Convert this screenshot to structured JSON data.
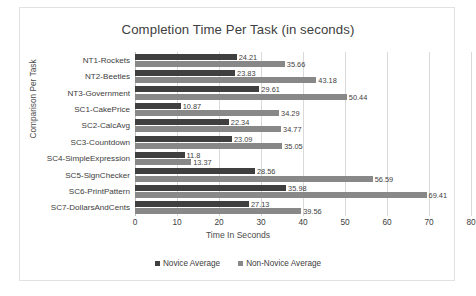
{
  "chart_data": {
    "type": "bar",
    "orientation": "horizontal",
    "title": "Completion Time Per Task (in seconds)",
    "xlabel": "Time In Seconds",
    "ylabel": "Comparison Per Task",
    "xlim": [
      0,
      80
    ],
    "xticks": [
      0,
      10,
      20,
      30,
      40,
      50,
      60,
      70,
      80
    ],
    "xtick_labels": [
      "0",
      "10",
      "20",
      "30",
      "40",
      "50",
      "60",
      "70",
      "80"
    ],
    "grid": true,
    "grid_axis": "x",
    "legend_position": "bottom",
    "categories": [
      "NT1-Rockets",
      "NT2-Beetles",
      "NT3-Government",
      "SC1-CakePrice",
      "SC2-CalcAvg",
      "SC3-Countdown",
      "SC4-SimpleExpression",
      "SC5-SignChecker",
      "SC6-PrintPattern",
      "SC7-DollarsAndCents"
    ],
    "series": [
      {
        "name": "Novice Average",
        "color": "#3f3f3f",
        "values": [
          24.21,
          23.83,
          29.61,
          10.87,
          22.34,
          23.09,
          11.8,
          28.56,
          35.98,
          27.13
        ],
        "labels": [
          "24.21",
          "23.83",
          "29.61",
          "10.87",
          "22.34",
          "23.09",
          "11.8",
          "28.56",
          "35.98",
          "27.13"
        ]
      },
      {
        "name": "Non-Novice Average",
        "color": "#888888",
        "values": [
          35.66,
          43.18,
          50.44,
          34.29,
          34.77,
          35.05,
          13.37,
          56.59,
          69.41,
          39.56
        ],
        "labels": [
          "35.66",
          "43.18",
          "50.44",
          "34.29",
          "34.77",
          "35.05",
          "13.37",
          "56.59",
          "69.41",
          "39.56"
        ]
      }
    ]
  }
}
